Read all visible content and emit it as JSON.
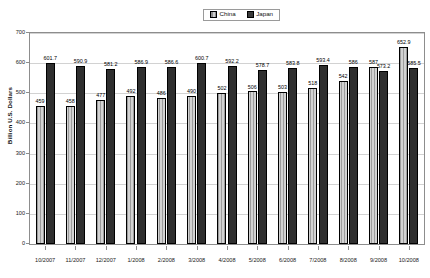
{
  "chart_data": {
    "type": "bar",
    "title": "",
    "xlabel": "",
    "ylabel": "Billion U.S. Dollars",
    "ylim": [
      0,
      700
    ],
    "ytick_step": 100,
    "yticks": [
      0,
      100,
      200,
      300,
      400,
      500,
      600,
      700
    ],
    "grid": true,
    "legend_position": "top-center",
    "categories": [
      "10/2007",
      "11/2007",
      "12/2007",
      "1/2008",
      "2/2008",
      "3/2008",
      "4/2008",
      "5/2008",
      "6/2008",
      "7/2008",
      "8/2008",
      "9/2008",
      "10/2008"
    ],
    "series": [
      {
        "name": "China",
        "color": "#bdbdbd",
        "values": [
          459,
          458,
          477,
          492,
          486,
          490,
          502,
          506,
          503,
          518,
          542,
          587,
          652.9
        ],
        "labels": [
          "459",
          "458",
          "477",
          "492",
          "486",
          "490",
          "502",
          "506",
          "503",
          "518",
          "542",
          "587",
          "652.9"
        ]
      },
      {
        "name": "Japan",
        "color": "#2f2f2f",
        "values": [
          601.7,
          590.9,
          581.2,
          586.9,
          586.6,
          600.7,
          592.2,
          578.7,
          583.8,
          593.4,
          586,
          573.2,
          585.5
        ],
        "labels": [
          "601.7",
          "590.9",
          "581.2",
          "586.9",
          "586.6",
          "600.7",
          "592.2",
          "578.7",
          "583.8",
          "593.4",
          "586",
          "573.2",
          "585.5"
        ]
      }
    ]
  },
  "legend": {
    "items": [
      {
        "label": "China",
        "swatch": "china-swatch"
      },
      {
        "label": "Japan",
        "swatch": "japan-swatch"
      }
    ]
  },
  "axis": {
    "y_title": "Billion U.S. Dollars"
  }
}
